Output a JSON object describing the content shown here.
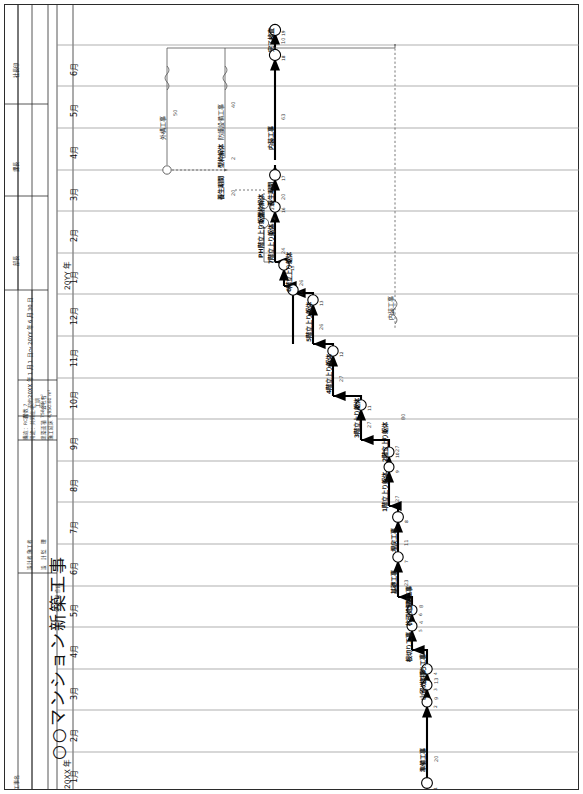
{
  "document": {
    "kind": "network-schedule",
    "project_title": "○○マンション新築工事",
    "title_label": "工事名",
    "date_line": "年   月   日  作成",
    "approval_cells": [
      {
        "label": "社長印"
      },
      {
        "label": "課長"
      },
      {
        "label": "部長"
      }
    ]
  },
  "titleblock": {
    "contract_label": "契約\n工期",
    "contract_period": "20XX 年 1 月 1 日 ～ 20YY 年 6 月 30 日",
    "company_label": "会社名",
    "rows": [
      {
        "label": "設計者\n施工者",
        "value": ""
      },
      {
        "label": "設　計\n監　理",
        "value": ""
      },
      {
        "label": "構造：RC造",
        "value": "階数 7"
      },
      {
        "label": "用途：共同住宅",
        "value": ""
      },
      {
        "label": "建築面積",
        "value": "758.86 m²"
      },
      {
        "label": "施工延床",
        "value": "4,950.60 m²"
      }
    ]
  },
  "calendar": {
    "year_start_label": "20XX 年",
    "year_second_label": "20YY 年",
    "months": [
      {
        "m": "1月",
        "year": "20XX 年"
      },
      {
        "m": "2月",
        "year": ""
      },
      {
        "m": "3月",
        "year": ""
      },
      {
        "m": "4月",
        "year": ""
      },
      {
        "m": "5月",
        "year": ""
      },
      {
        "m": "6月",
        "year": ""
      },
      {
        "m": "7月",
        "year": ""
      },
      {
        "m": "8月",
        "year": ""
      },
      {
        "m": "9月",
        "year": ""
      },
      {
        "m": "10月",
        "year": ""
      },
      {
        "m": "11月",
        "year": ""
      },
      {
        "m": "12月",
        "year": ""
      },
      {
        "m": "1月",
        "year": "20YY 年"
      },
      {
        "m": "2月",
        "year": ""
      },
      {
        "m": "3月",
        "year": ""
      },
      {
        "m": "4月",
        "year": ""
      },
      {
        "m": "5月",
        "year": ""
      },
      {
        "m": "6月",
        "year": ""
      }
    ]
  },
  "chart_data": {
    "type": "network-diagram",
    "xlabel": "工期（月）",
    "ylabel": "",
    "tasks": [
      {
        "name": "準備工事",
        "duration": 20,
        "label": "準備工事",
        "dur_text": "20"
      },
      {
        "name": "山留め工事",
        "duration": 9,
        "label": "山留め工事",
        "dur_text": "9"
      },
      {
        "name": "杭打ち工事",
        "duration": 13,
        "label": "杭打ち工事",
        "dur_text": "13"
      },
      {
        "name": "根切り工事",
        "duration": 6,
        "label": "根切り工事",
        "dur_text": "6"
      },
      {
        "name": "杭頭処理",
        "duration": 4,
        "label": "杭頭処理",
        "dur_text": "4"
      },
      {
        "name": "土間・地業工事",
        "duration": 8,
        "label": "土間工事",
        "dur_text": "8"
      },
      {
        "name": "基礎工事",
        "duration": 23,
        "label": "基礎工事",
        "dur_text": "23"
      },
      {
        "name": "埋戻工事",
        "duration": 11,
        "label": "埋戻工事",
        "dur_text": "11"
      },
      {
        "name": "1階立上り躯体",
        "duration": 27,
        "label": "1階立上り躯体",
        "dur_text": "27"
      },
      {
        "name": "2階立上り躯体",
        "duration": 27,
        "label": "2階立上り躯体",
        "dur_text": "27"
      },
      {
        "name": "3階立上り躯体",
        "duration": 27,
        "label": "3階立上り躯体",
        "dur_text": "27"
      },
      {
        "name": "4階立上り躯体",
        "duration": 27,
        "label": "4階立上り躯体",
        "dur_text": "27"
      },
      {
        "name": "5階立上り躯体",
        "duration": 26,
        "label": "5階立上り躯体",
        "dur_text": "26"
      },
      {
        "name": "6階立上り躯体",
        "duration": 26,
        "label": "6階立上り躯体",
        "dur_text": "26"
      },
      {
        "name": "7階立上り躯体",
        "duration": 24,
        "label": "7階立上り躯体",
        "dur_text": "24"
      },
      {
        "name": "PH階立上り躯体",
        "duration": 12,
        "label": "PH階立上り躯体",
        "dur_text": "12"
      },
      {
        "name": "養生期間",
        "duration": 20,
        "label": "養生期間",
        "dur_text": "20"
      },
      {
        "name": "型枠解体",
        "duration": 2,
        "label": "型枠解体",
        "dur_text": "2"
      },
      {
        "name": "養生期間2",
        "duration": 20,
        "label": "養生期間",
        "dur_text": "20"
      },
      {
        "name": "型枠解体2",
        "duration": 2,
        "label": "型枠解体",
        "dur_text": "2"
      },
      {
        "name": "内装工事",
        "duration": 63,
        "label": "内装工事",
        "dur_text": "63"
      },
      {
        "name": "外構工事",
        "duration": 50,
        "label": "外構工事",
        "dur_text": "50"
      },
      {
        "name": "防護設備工事",
        "duration": 40,
        "label": "防護設備工事",
        "dur_text": "40"
      },
      {
        "name": "内装工事(ダミー)",
        "duration": 80,
        "label": "内装工事",
        "dur_text": "80"
      },
      {
        "name": "完了検査",
        "duration": 10,
        "label": "完了検査",
        "dur_text": "10"
      }
    ],
    "node_numbers": [
      "1",
      "2",
      "3",
      "4",
      "5",
      "6",
      "7",
      "8",
      "9",
      "10",
      "11",
      "12",
      "13",
      "14",
      "15",
      "16",
      "17",
      "18",
      "19",
      "20",
      "21"
    ],
    "critical_path": true,
    "legend": []
  }
}
